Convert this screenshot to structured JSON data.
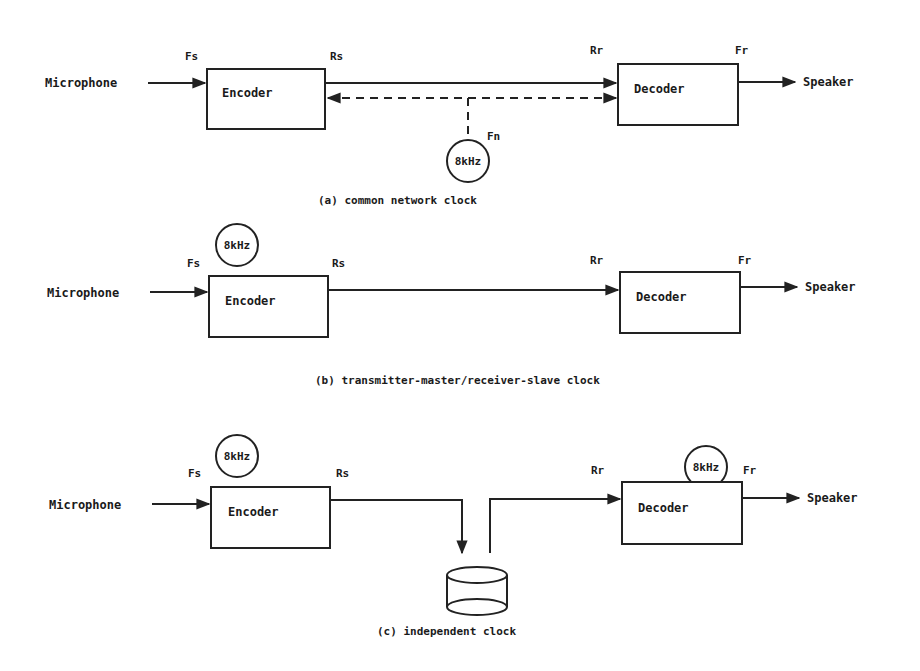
{
  "figure": {
    "colors": {
      "ink": "#222222",
      "background": "#ffffff"
    },
    "panels": [
      {
        "id": "a",
        "caption": "(a) common network clock",
        "input_label": "Microphone",
        "output_label": "Speaker",
        "encoder_label": "Encoder",
        "decoder_label": "Decoder",
        "fs_label": "Fs",
        "rs_label": "Rs",
        "rr_label": "Rr",
        "fr_label": "Fr",
        "fn_label": "Fn",
        "clock_label": "8kHz"
      },
      {
        "id": "b",
        "caption": "(b) transmitter-master/receiver-slave clock",
        "input_label": "Microphone",
        "output_label": "Speaker",
        "encoder_label": "Encoder",
        "decoder_label": "Decoder",
        "fs_label": "Fs",
        "rs_label": "Rs",
        "rr_label": "Rr",
        "fr_label": "Fr",
        "clock_label": "8kHz"
      },
      {
        "id": "c",
        "caption": "(c) independent clock",
        "input_label": "Microphone",
        "output_label": "Speaker",
        "encoder_label": "Encoder",
        "decoder_label": "Decoder",
        "fs_label": "Fs",
        "rs_label": "Rs",
        "rr_label": "Rr",
        "fr_label": "Fr",
        "encoder_clock_label": "8kHz",
        "decoder_clock_label": "8kHz"
      }
    ]
  }
}
